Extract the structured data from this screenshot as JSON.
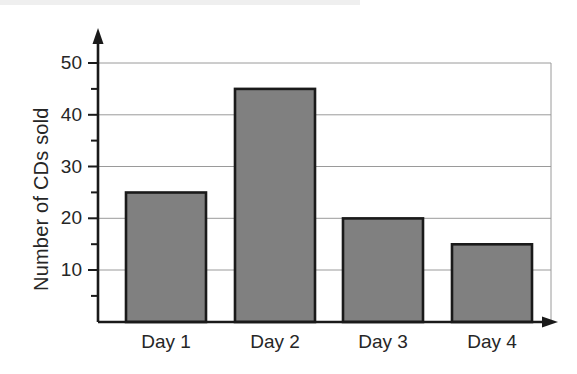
{
  "chart_data": {
    "type": "bar",
    "title": "",
    "xlabel": "",
    "ylabel": "Number of CDs sold",
    "categories": [
      "Day 1",
      "Day 2",
      "Day 3",
      "Day 4"
    ],
    "values": [
      25,
      45,
      20,
      15
    ],
    "ylim": [
      0,
      52
    ],
    "ytick_labels": [
      "10",
      "20",
      "30",
      "40",
      "50"
    ],
    "ytick_values": [
      10,
      20,
      30,
      40,
      50
    ],
    "minor_tick_values": [
      5,
      15,
      25,
      35,
      45
    ],
    "grid": "horizontal",
    "legend": "none",
    "bar_fill": "#808080",
    "bar_stroke": "#1a1a1a",
    "grid_color": "#9a9a9a",
    "axis_color": "#1a1a1a"
  },
  "axes": {
    "y_axis_title": "Number of CDs sold",
    "y_labels": [
      "50",
      "40",
      "30",
      "20",
      "10"
    ],
    "x_labels": [
      "Day 1",
      "Day 2",
      "Day 3",
      "Day 4"
    ]
  }
}
